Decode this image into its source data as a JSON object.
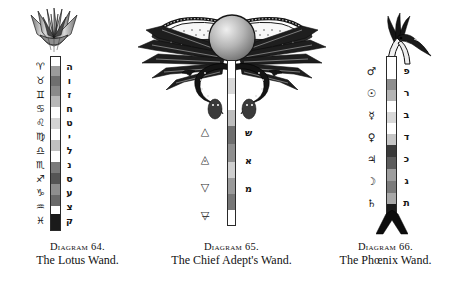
{
  "plate": {
    "background": "#ffffff",
    "ink": "#111111"
  },
  "figures": [
    {
      "id": "lotus-wand",
      "diagram_label": "Diagram 64.",
      "title": "The Lotus Wand.",
      "head_icon": "lotus-flower-icon",
      "shaft": {
        "top_band_color": "#ffffff",
        "bottom_band_color": "#000000",
        "band_colors": [
          "#ffffff",
          "#9b9b9b",
          "#6f6f6f",
          "#8a8a8a",
          "#b8b8b8",
          "#ffffff",
          "#d4d4d4",
          "#ffffff",
          "#c0c0c0",
          "#ffffff",
          "#7a7a7a",
          "#555555",
          "#8e8e8e",
          "#6a6a6a",
          "#ffffff",
          "#1a1a1a"
        ]
      },
      "left_glyphs": {
        "name": "zodiac-signs",
        "items": [
          "♈",
          "♉",
          "♊",
          "♋",
          "♌",
          "♍",
          "♎",
          "♏",
          "♐",
          "♑",
          "♒",
          "♓"
        ],
        "names": [
          "Aries",
          "Taurus",
          "Gemini",
          "Cancer",
          "Leo",
          "Virgo",
          "Libra",
          "Scorpio",
          "Sagittarius",
          "Capricorn",
          "Aquarius",
          "Pisces"
        ]
      },
      "right_glyphs": {
        "name": "hebrew-simple-letters",
        "items": [
          "ה",
          "ו",
          "ז",
          "ח",
          "ט",
          "י",
          "ל",
          "נ",
          "ס",
          "ע",
          "צ",
          "ק"
        ],
        "names": [
          "He",
          "Vav",
          "Zayin",
          "Cheth",
          "Teth",
          "Yod",
          "Lamed",
          "Nun",
          "Samekh",
          "Ayin",
          "Tzaddi",
          "Qoph"
        ]
      }
    },
    {
      "id": "chief-adepts-wand",
      "diagram_label": "Diagram 65.",
      "title": "The Chief Adept's Wand.",
      "head_icon": "winged-solar-disk-icon",
      "serpent_icon": "uraeus-serpent-icon",
      "shaft": {
        "band_colors": [
          "#ffffff",
          "#d8d8d8",
          "#ffffff",
          "#bdbdbd",
          "#6e6e6e",
          "#8f8f8f",
          "#cfcfcf",
          "#9a9a9a",
          "#777777",
          "#ffffff"
        ]
      },
      "left_glyphs": {
        "name": "elemental-triangles",
        "items": [
          "△",
          "◬",
          "▽",
          "▽̶"
        ],
        "names": [
          "Fire",
          "Air",
          "Water",
          "Earth"
        ]
      },
      "right_glyphs": {
        "name": "hebrew-mother-letters",
        "items": [
          "ש",
          "א",
          "מ"
        ],
        "names": [
          "Shin",
          "Aleph",
          "Mem"
        ]
      }
    },
    {
      "id": "phoenix-wand",
      "diagram_label": "Diagram 66.",
      "title": "The Phœnix Wand.",
      "head_icon": "phoenix-head-icon",
      "foot_icon": "forked-base-icon",
      "shaft": {
        "band_colors": [
          "#ffffff",
          "#ffffff",
          "#8d8d8d",
          "#b4b4b4",
          "#ffffff",
          "#d8d8d8",
          "#ffffff",
          "#c6c6c6",
          "#3a3a3a",
          "#5c5c5c",
          "#9d9d9d",
          "#7b7b7b",
          "#a8a8a8",
          "#1a1a1a"
        ]
      },
      "left_glyphs": {
        "name": "planetary-symbols",
        "items": [
          "♂",
          "☉",
          "☿",
          "♀",
          "♃",
          "☽",
          "♄"
        ],
        "names": [
          "Mars",
          "Sun",
          "Mercury",
          "Venus",
          "Jupiter",
          "Moon",
          "Saturn"
        ]
      },
      "right_glyphs": {
        "name": "hebrew-double-letters",
        "items": [
          "פ",
          "ר",
          "ב",
          "ד",
          "כ",
          "ג",
          "ת"
        ],
        "names": [
          "Peh",
          "Resh",
          "Beth",
          "Daleth",
          "Kaph",
          "Gimel",
          "Tav"
        ]
      }
    }
  ]
}
